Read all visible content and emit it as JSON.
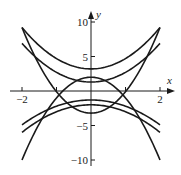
{
  "chart_data": {
    "type": "line",
    "title": "",
    "xlabel": "x",
    "ylabel": "y",
    "xlim": [
      -2,
      2
    ],
    "ylim": [
      -10,
      10
    ],
    "x_ticks": [
      {
        "value": -2,
        "label": "−2"
      },
      {
        "value": -1,
        "label": ""
      },
      {
        "value": 1,
        "label": ""
      },
      {
        "value": 2,
        "label": "2"
      }
    ],
    "y_ticks": [
      {
        "value": 10,
        "label": "10"
      },
      {
        "value": 5,
        "label": "5"
      },
      {
        "value": -5,
        "label": "−5"
      },
      {
        "value": -10,
        "label": "−10"
      }
    ],
    "grid": false,
    "legend": null,
    "series": [
      {
        "name": "curve-1",
        "a": 1.5,
        "c": 3.2,
        "x": [
          -2,
          -1,
          0,
          1,
          2
        ],
        "values": [
          9.2,
          4.7,
          3.2,
          4.7,
          9.2
        ]
      },
      {
        "name": "curve-2",
        "a": 1.4,
        "c": 1.3,
        "x": [
          -2,
          -1,
          0,
          1,
          2
        ],
        "values": [
          6.9,
          2.7,
          1.3,
          2.7,
          6.9
        ]
      },
      {
        "name": "curve-3",
        "a": 3.1,
        "c": -3.2,
        "x": [
          -2,
          -1,
          0,
          1,
          2
        ],
        "values": [
          9.2,
          -0.1,
          -3.2,
          -0.1,
          9.2
        ]
      },
      {
        "name": "curve-4",
        "a": -3.0,
        "c": 2.0,
        "x": [
          -2,
          -1,
          0,
          1,
          2
        ],
        "values": [
          -10.0,
          -1.0,
          2.0,
          -1.0,
          -10.0
        ]
      },
      {
        "name": "curve-5",
        "a": -0.9,
        "c": -1.3,
        "x": [
          -2,
          -1,
          0,
          1,
          2
        ],
        "values": [
          -4.9,
          -2.2,
          -1.3,
          -2.2,
          -4.9
        ]
      },
      {
        "name": "curve-6",
        "a": -1.0,
        "c": -2.0,
        "x": [
          -2,
          -1,
          0,
          1,
          2
        ],
        "values": [
          -6.0,
          -3.0,
          -2.0,
          -3.0,
          -6.0
        ]
      }
    ],
    "style": {
      "line_color": "#1a1a1a",
      "axis_color": "#1a1a1a",
      "background": "#ffffff"
    }
  },
  "axes": {
    "x_label": "x",
    "y_label": "y"
  }
}
